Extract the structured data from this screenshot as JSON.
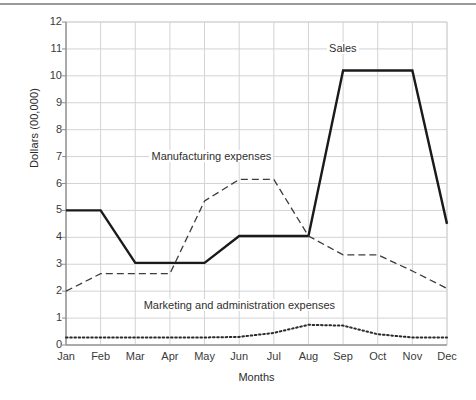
{
  "chart_data": {
    "type": "line",
    "title": "",
    "xlabel": "Months",
    "ylabel": "Dollars (00,000)",
    "categories": [
      "Jan",
      "Feb",
      "Mar",
      "Apr",
      "May",
      "Jun",
      "Jul",
      "Aug",
      "Sep",
      "Oct",
      "Nov",
      "Dec"
    ],
    "ylim": [
      0,
      12
    ],
    "yticks": [
      "0",
      "1",
      "2",
      "3",
      "4",
      "5",
      "6",
      "7",
      "8",
      "9",
      "10",
      "11",
      "12"
    ],
    "grid": true,
    "legend_position": "inline-annotations",
    "series": [
      {
        "name": "Sales",
        "style": "solid-thick",
        "color": "#1a1a1a",
        "values": [
          5.0,
          5.0,
          3.05,
          3.05,
          3.05,
          4.05,
          4.05,
          4.05,
          10.2,
          10.2,
          10.2,
          4.5
        ]
      },
      {
        "name": "Manufacturing expenses",
        "style": "dashed",
        "color": "#3c3c3c",
        "values": [
          2.0,
          2.65,
          2.65,
          2.65,
          5.35,
          6.15,
          6.15,
          4.05,
          3.35,
          3.35,
          2.75,
          2.1
        ]
      },
      {
        "name": "Marketing and administration expenses",
        "style": "dotted",
        "color": "#2a2a2a",
        "values": [
          0.28,
          0.28,
          0.28,
          0.28,
          0.28,
          0.3,
          0.45,
          0.75,
          0.72,
          0.4,
          0.28,
          0.28
        ]
      }
    ],
    "annotations": [
      {
        "text": "Sales",
        "x": 8,
        "y": 11.0
      },
      {
        "text": "Manufacturing expenses",
        "x": 4.2,
        "y": 7.0
      },
      {
        "text": "Marketing and administration expenses",
        "x": 5.0,
        "y": 1.45
      }
    ]
  }
}
